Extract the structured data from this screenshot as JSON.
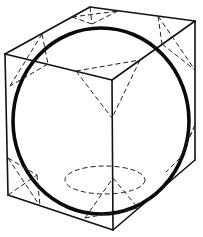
{
  "figure": {
    "type": "cube with inscribed sphere and truncated-corner markings",
    "colors": {
      "background": "#ffffff",
      "line": "#111111",
      "sphere": "#0a0a0a"
    },
    "cube": {
      "vertices": {
        "top_back": [
          90,
          7
        ],
        "top_right": [
          195,
          21
        ],
        "top_left": [
          5,
          54
        ],
        "top_front": [
          112,
          80
        ],
        "bottom_left": [
          8,
          195
        ],
        "bottom_front": [
          113,
          230
        ],
        "bottom_right": [
          195,
          160
        ]
      }
    },
    "sphere": {
      "cx": 101,
      "cy": 121,
      "rx": 88,
      "ry": 93
    },
    "bottom_ellipse": {
      "cx": 105,
      "cy": 180,
      "rx": 40,
      "ry": 14,
      "style": "dashed"
    }
  }
}
